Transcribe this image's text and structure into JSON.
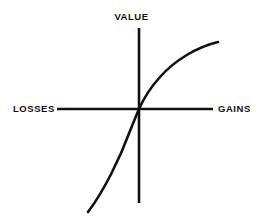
{
  "figure": {
    "background_color": "#ffffff",
    "stroke_color": "#111111"
  },
  "labels": {
    "value": "VALUE",
    "losses": "LOSSES",
    "gains": "GAINS"
  },
  "chart_data": {
    "type": "line",
    "title": "",
    "subtitle": "",
    "xlabel": "",
    "ylabel": "",
    "grid": false,
    "legend_position": "none",
    "axis_labels": {
      "x_negative": "LOSSES",
      "x_positive": "GAINS",
      "y_positive": "VALUE"
    },
    "origin": {
      "x": 0,
      "y": 0
    },
    "xlim": [
      -100,
      100
    ],
    "ylim": [
      -100,
      100
    ],
    "annotations": [
      {
        "text": "VALUE",
        "position": "top-center"
      },
      {
        "text": "LOSSES",
        "position": "left-axis-end"
      },
      {
        "text": "GAINS",
        "position": "right-axis-end"
      }
    ],
    "series": [
      {
        "name": "value function",
        "description": "Concave for gains, convex and steeper for losses",
        "x": [
          -72,
          -64,
          -56,
          -48,
          -40,
          -32,
          -24,
          -16,
          -8,
          0,
          10,
          20,
          30,
          40,
          50,
          60,
          70,
          80,
          90,
          100
        ],
        "y": [
          -118,
          -96,
          -78,
          -62,
          -49,
          -38,
          -28,
          -19,
          -9,
          0,
          16,
          28,
          38,
          46,
          52,
          58,
          63,
          68,
          72,
          76
        ]
      }
    ]
  },
  "geometry": {
    "origin_px": {
      "x": 139,
      "y": 109
    },
    "x_axis": {
      "x1": 57,
      "x2": 213,
      "y": 109
    },
    "y_axis": {
      "x": 139,
      "y1": 28,
      "y2": 203
    },
    "curve_path": "M 88 212 C 104 191, 120 158, 130 131 C 134 121, 137 114, 139 109 C 143 100, 150 88, 160 77 C 175 60, 197 47, 218 42"
  }
}
